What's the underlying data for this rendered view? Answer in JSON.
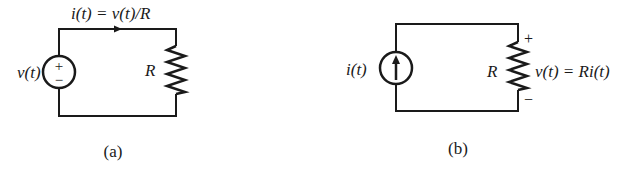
{
  "figures": [
    {
      "id": "a",
      "caption": "(a)",
      "source_type": "voltage-source",
      "source_label": "v(t)",
      "source_polarity": [
        "+",
        "−"
      ],
      "resistor_label": "R",
      "current_label": "i(t) = v(t)/R"
    },
    {
      "id": "b",
      "caption": "(b)",
      "source_type": "current-source",
      "source_label": "i(t)",
      "resistor_label": "R",
      "voltage_label": "v(t) = Ri(t)",
      "voltage_polarity": [
        "+",
        "−"
      ]
    }
  ],
  "colors": {
    "ink": "#1a1a1a",
    "background": "#ffffff"
  }
}
